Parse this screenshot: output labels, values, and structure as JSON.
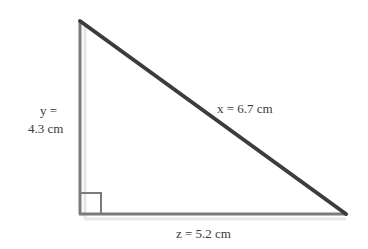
{
  "diagram": {
    "type": "right-triangle",
    "vertices": {
      "top": [
        80,
        21
      ],
      "right_angle": [
        80,
        214
      ],
      "bottom_right": [
        346,
        214
      ]
    },
    "sides": {
      "y": {
        "label_line1": "y =",
        "label_line2": "4.3 cm",
        "value": 4.3,
        "unit": "cm"
      },
      "x": {
        "label": "x = 6.7 cm",
        "value": 6.7,
        "unit": "cm"
      },
      "z": {
        "label": "z = 5.2 cm",
        "value": 5.2,
        "unit": "cm"
      }
    },
    "colors": {
      "hypotenuse": "#3c3c3c",
      "legs": "#7a7a7a",
      "text": "#3a3a3a"
    }
  }
}
